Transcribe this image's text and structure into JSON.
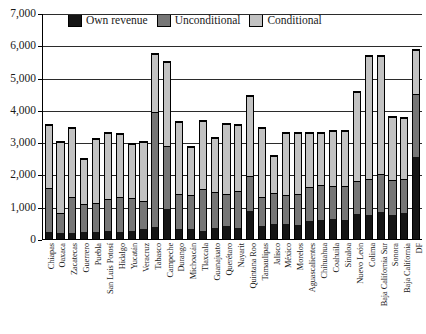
{
  "chart_data": {
    "type": "bar",
    "subtype": "stacked",
    "title": "",
    "subtitle": "",
    "xlabel": "",
    "ylabel": "",
    "ylim": [
      0,
      7000
    ],
    "ytick_labels": [
      "7,000",
      "6,000",
      "5,000",
      "4,000",
      "3,000",
      "2,000",
      "1,000",
      "0"
    ],
    "ytick_values": [
      7000,
      6000,
      5000,
      4000,
      3000,
      2000,
      1000,
      0
    ],
    "grid": true,
    "legend_position": "top",
    "categories": [
      "Chiapas",
      "Oaxaca",
      "Zacatecas",
      "Guerrero",
      "Puebla",
      "San Luis Potosí",
      "Hidalgo",
      "Yucatán",
      "Veracruz",
      "Tabasco",
      "Campeche",
      "Durango",
      "Michoacán",
      "Tlaxcala",
      "Guanajuato",
      "Querétaro",
      "Nayarit",
      "Quintana Roo",
      "Tamaulipas",
      "Jalisco",
      "México",
      "Morelos",
      "Aguascalientes",
      "Chihuahua",
      "Coahuila",
      "Sinaloa",
      "Nuevo León",
      "Colima",
      "Baja California Sur",
      "Sonora",
      "Baja California",
      "DF"
    ],
    "series": [
      {
        "name": "Own revenue",
        "color": "#151515",
        "values": [
          230,
          180,
          200,
          210,
          230,
          250,
          220,
          250,
          300,
          380,
          930,
          300,
          320,
          250,
          350,
          400,
          330,
          880,
          420,
          470,
          480,
          430,
          560,
          600,
          620,
          600,
          780,
          750,
          850,
          760,
          820,
          2550
        ]
      },
      {
        "name": "Unconditional",
        "color": "#767676",
        "values": [
          1370,
          620,
          1100,
          890,
          890,
          1000,
          1080,
          1030,
          900,
          3570,
          1970,
          1120,
          1060,
          1320,
          1110,
          1000,
          1170,
          1080,
          900,
          980,
          900,
          970,
          1080,
          1090,
          1040,
          1070,
          1020,
          1110,
          1180,
          1090,
          1060,
          1950
        ]
      },
      {
        "name": "Conditional",
        "color": "#c2c2c2",
        "values": [
          1950,
          2250,
          2180,
          1400,
          2010,
          2060,
          1990,
          1700,
          1840,
          1800,
          2600,
          2250,
          1510,
          2120,
          1700,
          2180,
          2060,
          2490,
          2150,
          1150,
          1920,
          1900,
          1660,
          1620,
          1710,
          1710,
          2800,
          3840,
          3670,
          1960,
          1900,
          1400
        ]
      }
    ],
    "totals": [
      3550,
      3050,
      3480,
      2500,
      3130,
      3310,
      3290,
      2980,
      3040,
      5750,
      5500,
      3670,
      2890,
      3690,
      3160,
      3580,
      3560,
      4450,
      3470,
      2600,
      3300,
      3300,
      3300,
      3310,
      3370,
      3380,
      4600,
      5700,
      5700,
      3810,
      3780,
      5900
    ]
  },
  "legend": {
    "entries": [
      {
        "label": "Own revenue",
        "color": "#151515"
      },
      {
        "label": "Unconditional",
        "color": "#767676"
      },
      {
        "label": "Conditional",
        "color": "#c2c2c2"
      }
    ]
  }
}
